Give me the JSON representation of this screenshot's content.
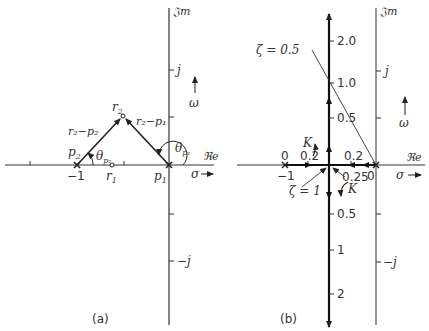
{
  "panel_a": {
    "caption": "(a)",
    "imag_axis_label": "𝔍m",
    "real_axis_label": "ℜe",
    "sigma_label": "σ",
    "omega_label": "ω",
    "tick_j": "j",
    "tick_minus_j": "−j",
    "tick_minus_1": "−1",
    "p1": "p",
    "p1_sub": "1",
    "p2": "p",
    "p2_sub": "2",
    "r1": "r",
    "r1_sub": "1",
    "r2": "r",
    "r2_sub": "2",
    "vec_r2_p2": "r₂−p₂",
    "vec_r2_p1": "r₂−p₁",
    "theta_p1": "θ",
    "theta_p1_sub": "p₁",
    "theta_p2": "θ",
    "theta_p2_sub": "p₂"
  },
  "panel_b": {
    "caption": "(b)",
    "imag_axis_label": "𝔍m",
    "real_axis_label": "ℜe",
    "sigma_label": "σ",
    "omega_label": "ω",
    "tick_j": "j",
    "tick_minus_j": "−j",
    "tick_minus_1": "−1",
    "zeta_05": "ζ = 0.5",
    "zeta_1": "ζ = 1",
    "K_upper": "K",
    "K_lower": "K",
    "gain_labels_real": [
      "0",
      "0.2",
      "0.2",
      "0",
      "0.25"
    ],
    "gain_labels_imag_upper": [
      "2.0",
      "1.0",
      "0.5"
    ],
    "gain_labels_imag_lower": [
      "0.5",
      "1",
      "2"
    ]
  }
}
